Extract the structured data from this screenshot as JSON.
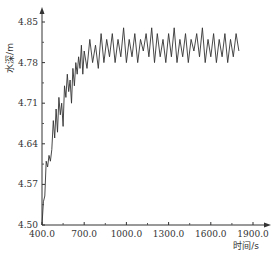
{
  "chart_data": {
    "type": "line",
    "title": "",
    "xlabel": "时间/s",
    "ylabel": "水深/m",
    "xlim": [
      400,
      1900
    ],
    "ylim": [
      4.5,
      4.85
    ],
    "x_ticks": [
      "400.0",
      "700.0",
      "1000.0",
      "1300.0",
      "1600.0",
      "1900.0"
    ],
    "y_ticks": [
      "4.50",
      "4.57",
      "4.64",
      "4.71",
      "4.78",
      "4.85"
    ],
    "grid": false,
    "legend": null,
    "series": [
      {
        "name": "水深",
        "color": "#333333",
        "x": [
          400,
          410,
          420,
          430,
          440,
          450,
          460,
          470,
          480,
          490,
          500,
          510,
          520,
          530,
          540,
          550,
          560,
          570,
          580,
          590,
          600,
          610,
          620,
          630,
          640,
          650,
          660,
          670,
          680,
          690,
          700,
          720,
          740,
          760,
          780,
          800,
          820,
          840,
          860,
          880,
          900,
          920,
          940,
          960,
          980,
          1000,
          1020,
          1040,
          1060,
          1080,
          1100,
          1120,
          1140,
          1160,
          1180,
          1200,
          1220,
          1240,
          1260,
          1280,
          1300,
          1320,
          1340,
          1360,
          1380,
          1400,
          1420,
          1440,
          1460,
          1480,
          1500,
          1520,
          1540,
          1560,
          1580,
          1600,
          1620,
          1640,
          1660,
          1680,
          1700,
          1720,
          1740,
          1760,
          1780,
          1800
        ],
        "values": [
          4.5,
          4.54,
          4.55,
          4.61,
          4.6,
          4.62,
          4.61,
          4.63,
          4.68,
          4.65,
          4.7,
          4.66,
          4.72,
          4.69,
          4.71,
          4.67,
          4.74,
          4.72,
          4.76,
          4.73,
          4.75,
          4.71,
          4.77,
          4.74,
          4.78,
          4.76,
          4.79,
          4.77,
          4.81,
          4.76,
          4.8,
          4.77,
          4.82,
          4.78,
          4.81,
          4.77,
          4.83,
          4.78,
          4.82,
          4.79,
          4.83,
          4.78,
          4.82,
          4.79,
          4.84,
          4.78,
          4.82,
          4.79,
          4.83,
          4.78,
          4.82,
          4.8,
          4.83,
          4.79,
          4.84,
          4.78,
          4.83,
          4.79,
          4.82,
          4.78,
          4.83,
          4.79,
          4.84,
          4.78,
          4.82,
          4.79,
          4.83,
          4.78,
          4.82,
          4.8,
          4.83,
          4.79,
          4.84,
          4.78,
          4.82,
          4.79,
          4.83,
          4.78,
          4.82,
          4.79,
          4.83,
          4.78,
          4.82,
          4.79,
          4.83,
          4.8
        ]
      }
    ]
  },
  "layout_px": {
    "x0": 42,
    "x1": 253,
    "y0": 225,
    "y1": 22
  }
}
